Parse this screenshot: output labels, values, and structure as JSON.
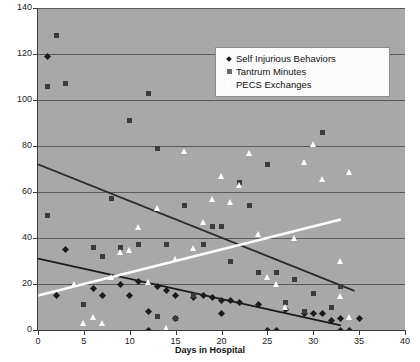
{
  "chart_data": {
    "type": "scatter",
    "title": "",
    "xlabel": "Days in Hospital",
    "ylabel": "",
    "xlim": [
      0,
      40
    ],
    "ylim": [
      0,
      140
    ],
    "xticks": [
      0,
      5,
      10,
      15,
      20,
      25,
      30,
      35,
      40
    ],
    "yticks": [
      0,
      20,
      40,
      60,
      80,
      100,
      120,
      140
    ],
    "grid": true,
    "legend_position": "top-right",
    "plot_background": "#a8a8a8",
    "series": [
      {
        "name": "Self Injurious Behaviors",
        "marker": "diamond",
        "color": "#1b1b1b",
        "points": [
          [
            1,
            119
          ],
          [
            2,
            15
          ],
          [
            3,
            35
          ],
          [
            6,
            18
          ],
          [
            7,
            15
          ],
          [
            9,
            20
          ],
          [
            10,
            15
          ],
          [
            11,
            21
          ],
          [
            12,
            0
          ],
          [
            12,
            8
          ],
          [
            13,
            19
          ],
          [
            14,
            17
          ],
          [
            15,
            5
          ],
          [
            15,
            15
          ],
          [
            17,
            14
          ],
          [
            18,
            15
          ],
          [
            19,
            14
          ],
          [
            20,
            13
          ],
          [
            20,
            7
          ],
          [
            21,
            13
          ],
          [
            22,
            12
          ],
          [
            24,
            11
          ],
          [
            25,
            0
          ],
          [
            26,
            0
          ],
          [
            27,
            9
          ],
          [
            29,
            7
          ],
          [
            30,
            7
          ],
          [
            31,
            7
          ],
          [
            32,
            4
          ],
          [
            33,
            0
          ],
          [
            33,
            5
          ],
          [
            34,
            0
          ],
          [
            35,
            5
          ]
        ],
        "trendline": {
          "x0": 0,
          "y0": 31,
          "x1": 33,
          "y1": 2,
          "color": "#1b1b1b"
        }
      },
      {
        "name": "Tantrum Minutes",
        "marker": "square",
        "color": "#3c3c3c",
        "points": [
          [
            1,
            50
          ],
          [
            1,
            106
          ],
          [
            2,
            128
          ],
          [
            3,
            107
          ],
          [
            5,
            11
          ],
          [
            6,
            36
          ],
          [
            7,
            32
          ],
          [
            8,
            57
          ],
          [
            9,
            36
          ],
          [
            10,
            91
          ],
          [
            11,
            37
          ],
          [
            12,
            103
          ],
          [
            13,
            79
          ],
          [
            13,
            6
          ],
          [
            14,
            37
          ],
          [
            15,
            5
          ],
          [
            16,
            54
          ],
          [
            17,
            15
          ],
          [
            18,
            37
          ],
          [
            19,
            45
          ],
          [
            20,
            45
          ],
          [
            21,
            30
          ],
          [
            22,
            64
          ],
          [
            23,
            54
          ],
          [
            24,
            25
          ],
          [
            25,
            72
          ],
          [
            26,
            25
          ],
          [
            27,
            12
          ],
          [
            28,
            22
          ],
          [
            29,
            8
          ],
          [
            30,
            16
          ],
          [
            31,
            86
          ],
          [
            32,
            10
          ],
          [
            33,
            19
          ]
        ],
        "trendline": {
          "x0": 0,
          "y0": 72,
          "x1": 34.5,
          "y1": 17,
          "color": "#2b2b2b"
        }
      },
      {
        "name": "PECS Exchanges",
        "marker": "triangle",
        "color": "#ffffff",
        "points": [
          [
            4,
            19
          ],
          [
            5,
            2
          ],
          [
            6,
            5
          ],
          [
            7,
            2
          ],
          [
            8,
            22
          ],
          [
            9,
            33
          ],
          [
            10,
            34
          ],
          [
            11,
            44
          ],
          [
            12,
            20
          ],
          [
            13,
            52
          ],
          [
            14,
            0
          ],
          [
            15,
            30
          ],
          [
            16,
            77
          ],
          [
            17,
            35
          ],
          [
            18,
            46
          ],
          [
            19,
            56
          ],
          [
            20,
            66
          ],
          [
            21,
            55
          ],
          [
            22,
            62
          ],
          [
            23,
            76
          ],
          [
            24,
            41
          ],
          [
            25,
            22
          ],
          [
            26,
            19
          ],
          [
            27,
            9
          ],
          [
            28,
            39
          ],
          [
            29,
            72
          ],
          [
            30,
            80
          ],
          [
            31,
            65
          ],
          [
            33,
            14
          ],
          [
            33,
            29
          ],
          [
            34,
            5
          ],
          [
            34,
            68
          ]
        ],
        "trendline": {
          "x0": 0,
          "y0": 15,
          "x1": 33,
          "y1": 48,
          "color": "#ffffff"
        }
      }
    ]
  },
  "legend": {
    "items": [
      {
        "label": "Self Injurious Behaviors",
        "marker": "diamond"
      },
      {
        "label": "Tantrum Minutes",
        "marker": "square"
      },
      {
        "label": "PECS Exchanges",
        "marker": "triangle"
      }
    ]
  }
}
